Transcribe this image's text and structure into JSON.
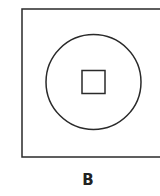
{
  "figure": {
    "label": "B",
    "shapes": {
      "outer": "square",
      "middle": "circle",
      "inner": "square"
    },
    "stroke_color": "#2a2a2a",
    "background": "#ffffff"
  }
}
